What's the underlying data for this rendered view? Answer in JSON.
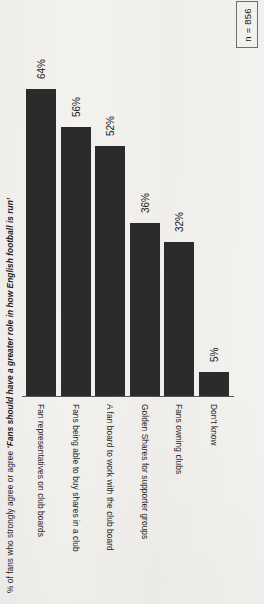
{
  "sample_size": {
    "label": "n = 856"
  },
  "title": {
    "prefix": "% of fans who strongly agree or agree ",
    "emphasis": "‘Fans should have a greater role in how English football is run’",
    "full": "% of fans who strongly agree or agree ‘Fans should have a greater role in how English football is run’"
  },
  "chart_data": {
    "type": "bar",
    "title": "% of fans who strongly agree or agree ‘Fans should have a greater role in how English football is run’",
    "xlabel": "",
    "ylabel": "",
    "ylim": [
      0,
      70
    ],
    "grid": false,
    "legend": "none",
    "orientation": "vertical-bars-on-rotated-page",
    "value_suffix": "%",
    "categories": [
      "Fan representatives on club boards",
      "Fans being able to buy shares in a club",
      "A fan board to work with the club board",
      "Golden Shares for supporter groups",
      "Fans owning clubs",
      "Don't know"
    ],
    "values": [
      64,
      56,
      52,
      36,
      32,
      5
    ],
    "value_labels": [
      "64%",
      "56%",
      "52%",
      "36%",
      "32%",
      "5%"
    ],
    "colors": {
      "bar": "#2b2b2b",
      "background": "#f4f2ef",
      "axis": "#54555a",
      "text": "#1a1b1d"
    }
  }
}
